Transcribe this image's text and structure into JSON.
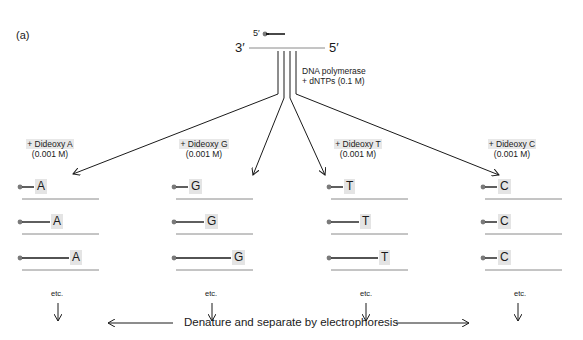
{
  "figure": {
    "panel_label": "(a)",
    "template": {
      "primer_five_prime": "5′",
      "strand_left_end": "3′",
      "strand_right_end": "5′"
    },
    "reaction_mix": {
      "line1": "DNA polymerase",
      "line2": "+ dNTPs (0.1 M)"
    },
    "reactions": [
      {
        "name": "A",
        "condition": "+ Dideoxy A",
        "concentration": "(0.001 M)",
        "terminator": "A",
        "fragments": [
          "A",
          "A",
          "A"
        ],
        "etc": "etc."
      },
      {
        "name": "G",
        "condition": "+ Dideoxy G",
        "concentration": "(0.001 M)",
        "terminator": "G",
        "fragments": [
          "G",
          "G",
          "G"
        ],
        "etc": "etc."
      },
      {
        "name": "T",
        "condition": "+ Dideoxy T",
        "concentration": "(0.001 M)",
        "terminator": "T",
        "fragments": [
          "T",
          "T",
          "T"
        ],
        "etc": "etc."
      },
      {
        "name": "C",
        "condition": "+ Dideoxy C",
        "concentration": "(0.001 M)",
        "terminator": "C",
        "fragments": [
          "C",
          "C",
          "C"
        ],
        "etc": "etc."
      }
    ],
    "bottom_step": "Denature and separate by electrophoresis",
    "colors": {
      "ink": "#1a1a1a",
      "template_gray": "#8a8a8a",
      "primer_dot": "#7a7a7a",
      "highlight": "#e4e4e4"
    }
  }
}
